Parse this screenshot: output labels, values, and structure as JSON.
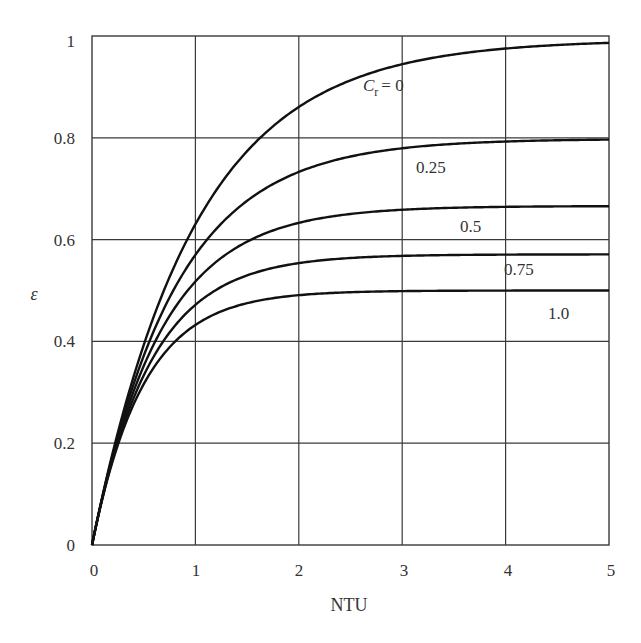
{
  "chart_data": {
    "type": "line",
    "title": "",
    "xlabel": "NTU",
    "ylabel": "ε",
    "xlim": [
      0,
      5
    ],
    "ylim": [
      0,
      1
    ],
    "grid": true,
    "legend": "inline curve labels",
    "x_ticks": [
      "0",
      "1",
      "2",
      "3",
      "4",
      "5"
    ],
    "y_ticks": [
      "0",
      "0.2",
      "0.4",
      "0.6",
      "0.8",
      "1"
    ],
    "x": [
      0,
      0.1,
      0.2,
      0.3,
      0.4,
      0.5,
      0.75,
      1.0,
      1.25,
      1.5,
      2.0,
      2.5,
      3.0,
      3.5,
      4.0,
      4.5,
      5.0
    ],
    "series": [
      {
        "name": "C_r = 0",
        "label": "0",
        "values": [
          0,
          0.095,
          0.181,
          0.259,
          0.33,
          0.393,
          0.528,
          0.632,
          0.713,
          0.777,
          0.865,
          0.918,
          0.95,
          0.97,
          0.982,
          0.989,
          0.993
        ]
      },
      {
        "name": "C_r = 0.25",
        "label": "0.25",
        "values": [
          0,
          0.094,
          0.177,
          0.249,
          0.314,
          0.371,
          0.487,
          0.571,
          0.632,
          0.676,
          0.734,
          0.764,
          0.781,
          0.789,
          0.794,
          0.797,
          0.798
        ]
      },
      {
        "name": "C_r = 0.5",
        "label": "0.5",
        "values": [
          0,
          0.093,
          0.173,
          0.241,
          0.3,
          0.35,
          0.449,
          0.518,
          0.563,
          0.596,
          0.634,
          0.651,
          0.659,
          0.663,
          0.665,
          0.666,
          0.666
        ]
      },
      {
        "name": "C_r = 0.75",
        "label": "0.75",
        "values": [
          0,
          0.092,
          0.169,
          0.233,
          0.286,
          0.33,
          0.415,
          0.469,
          0.503,
          0.526,
          0.55,
          0.56,
          0.566,
          0.569,
          0.57,
          0.571,
          0.571
        ]
      },
      {
        "name": "C_r = 1.0",
        "label": "1.0",
        "values": [
          0,
          0.091,
          0.165,
          0.226,
          0.275,
          0.316,
          0.389,
          0.432,
          0.459,
          0.475,
          0.491,
          0.497,
          0.499,
          0.5,
          0.5,
          0.5,
          0.5
        ]
      }
    ],
    "annotations": [
      {
        "text": "C_r = 0",
        "near": "upper curve at NTU≈3"
      },
      {
        "text": "0.25",
        "near": "NTU≈3.2"
      },
      {
        "text": "0.5",
        "near": "NTU≈3.6"
      },
      {
        "text": "0.75",
        "near": "NTU≈4.1"
      },
      {
        "text": "1.0",
        "near": "NTU≈4.5"
      }
    ]
  },
  "labels": {
    "x_axis": "NTU",
    "y_axis": "ε",
    "cr_symbol": "C",
    "cr_subscript": "r",
    "cr_eq": "= 0",
    "curve_025": "0.25",
    "curve_05": "0.5",
    "curve_075": "0.75",
    "curve_10": "1.0",
    "x_ticks": [
      "0",
      "1",
      "2",
      "3",
      "4",
      "5"
    ],
    "y_ticks": [
      "0",
      "0.2",
      "0.4",
      "0.6",
      "0.8",
      "1"
    ]
  }
}
